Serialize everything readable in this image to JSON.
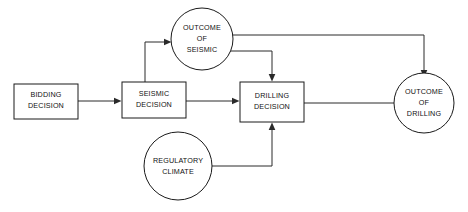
{
  "diagram": {
    "canvas": {
      "width": 468,
      "height": 212,
      "background": "#ffffff"
    },
    "stroke_color": "#2a2a2a",
    "text_color": "#111111",
    "nodes": [
      {
        "id": "bidding-decision",
        "shape": "rectangle",
        "kind": "decision",
        "line1": "BIDDING",
        "line2": "DECISION",
        "x": 14,
        "y": 84,
        "width": 64,
        "height": 35
      },
      {
        "id": "seismic-decision",
        "shape": "rectangle",
        "kind": "decision",
        "line1": "SEISMIC",
        "line2": "DECISION",
        "x": 122,
        "y": 82,
        "width": 64,
        "height": 36
      },
      {
        "id": "drilling-decision",
        "shape": "rectangle",
        "kind": "decision",
        "line1": "DRILLING",
        "line2": "DECISION",
        "x": 240,
        "y": 82,
        "width": 64,
        "height": 40
      },
      {
        "id": "outcome-of-seismic",
        "shape": "circle",
        "kind": "chance",
        "line1": "OUTCOME",
        "line2": "OF",
        "line3": "SEISMIC",
        "cx": 202,
        "cy": 39,
        "r": 31
      },
      {
        "id": "regulatory-climate",
        "shape": "circle",
        "kind": "chance",
        "line1": "REGULATORY",
        "line2": "CLIMATE",
        "cx": 178,
        "cy": 166,
        "r": 34
      },
      {
        "id": "outcome-of-drilling",
        "shape": "circle",
        "kind": "chance",
        "line1": "OUTCOME",
        "line2": "OF",
        "line3": "DRILLING",
        "cx": 424,
        "cy": 103,
        "r": 30
      }
    ],
    "edges": [
      {
        "id": "bidding-to-seismic",
        "from": "bidding-decision",
        "to": "seismic-decision",
        "arrow": true
      },
      {
        "id": "seismic-to-outcome-of-seismic",
        "from": "seismic-decision",
        "to": "outcome-of-seismic",
        "arrow": true
      },
      {
        "id": "seismic-to-drilling",
        "from": "seismic-decision",
        "to": "drilling-decision",
        "arrow": true
      },
      {
        "id": "outcome-of-seismic-to-drilling",
        "from": "outcome-of-seismic",
        "to": "drilling-decision",
        "arrow": true
      },
      {
        "id": "outcome-of-seismic-to-outcome-of-drilling",
        "from": "outcome-of-seismic",
        "to": "outcome-of-drilling",
        "arrow": true
      },
      {
        "id": "regulatory-to-drilling",
        "from": "regulatory-climate",
        "to": "drilling-decision",
        "arrow": true
      },
      {
        "id": "drilling-to-outcome-of-drilling",
        "from": "drilling-decision",
        "to": "outcome-of-drilling",
        "arrow": false
      }
    ]
  }
}
